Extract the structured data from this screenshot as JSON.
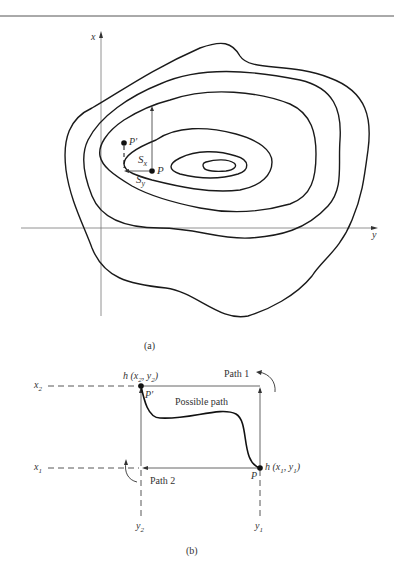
{
  "figure_a": {
    "caption": "(a)",
    "axis_x_label": "x",
    "axis_y_label": "y",
    "point_p_label": "P",
    "point_p_prime_label": "P'",
    "sx_label": "S",
    "sx_sub": "x",
    "sy_label": "S",
    "sy_sub": "y",
    "contour_count": 6
  },
  "figure_b": {
    "caption": "(b)",
    "h2_label": "h (x",
    "h2_sub1": "2",
    "h2_mid": ", y",
    "h2_sub2": "2",
    "h2_end": ")",
    "h1_label": "h (x",
    "h1_sub1": "1",
    "h1_mid": ", y",
    "h1_sub2": "1",
    "h1_end": ")",
    "x2_label": "x",
    "x2_sub": "2",
    "x1_label": "x",
    "x1_sub": "1",
    "y2_label": "y",
    "y2_sub": "2",
    "y1_label": "y",
    "y1_sub": "1",
    "p_label": "P",
    "p_prime_label": "P'",
    "path1_label": "Path 1",
    "path2_label": "Path 2",
    "possible_path_label": "Possible path"
  }
}
